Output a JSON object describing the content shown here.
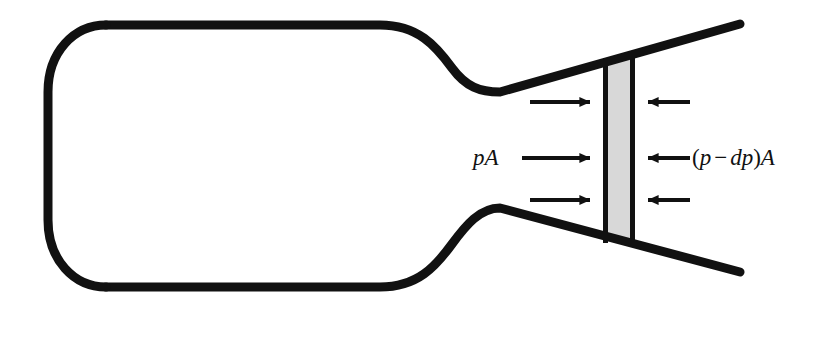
{
  "figure": {
    "background_color": "#ffffff",
    "stroke_color": "#111111",
    "slab_fill_color": "#d8d8d8",
    "slab_border_color": "#111111"
  },
  "labels": {
    "left_force": {
      "full_text": "pA",
      "variable_p": "p",
      "variable_A": "A"
    },
    "right_force": {
      "full_text": "(p − dp)A",
      "open_paren": "(",
      "variable_p": "p",
      "operator": "−",
      "differential_dp": "dp",
      "close_paren": ")",
      "variable_A": "A"
    }
  },
  "geometry": {
    "reservoir": {
      "name": "reservoir-bulb",
      "left_x": 48,
      "top_y": 25,
      "bottom_y": 287,
      "corner_radius": 58,
      "straight_end_x": 380
    },
    "throat": {
      "name": "nozzle-throat",
      "x": 500,
      "top_y": 92,
      "bottom_y": 208
    },
    "exit": {
      "name": "nozzle-exit",
      "x": 740,
      "top_y": 24,
      "bottom_y": 272
    },
    "slab": {
      "name": "control-volume-slab",
      "left_x": 604,
      "right_x": 634,
      "top_y": 60,
      "bottom_y": 241,
      "width": 30
    },
    "wall_stroke_width": 9
  },
  "arrows": {
    "left_group": {
      "direction": "right",
      "count": 3,
      "rows": [
        {
          "name": "arrow-left-top",
          "y": 102,
          "tail_x": 530,
          "head_x": 602
        },
        {
          "name": "arrow-left-middle",
          "y": 158,
          "tail_x": 522,
          "head_x": 602
        },
        {
          "name": "arrow-left-bottom",
          "y": 200,
          "tail_x": 530,
          "head_x": 602
        }
      ]
    },
    "right_group": {
      "direction": "left",
      "count": 3,
      "rows": [
        {
          "name": "arrow-right-top",
          "y": 102,
          "tail_x": 690,
          "head_x": 637
        },
        {
          "name": "arrow-right-middle",
          "y": 158,
          "tail_x": 690,
          "head_x": 637
        },
        {
          "name": "arrow-right-bottom",
          "y": 200,
          "tail_x": 690,
          "head_x": 637
        }
      ]
    },
    "shaft_width": 4,
    "head_length": 20,
    "head_half_height": 9
  }
}
